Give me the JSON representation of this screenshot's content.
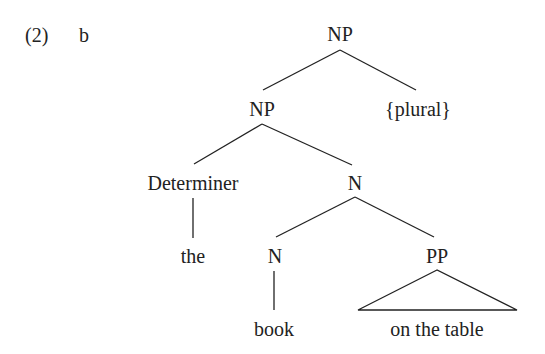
{
  "example": {
    "number": "(2)",
    "letter": "b"
  },
  "tree": {
    "root": "NP",
    "np": "NP",
    "plural": "{plural}",
    "determiner": "Determiner",
    "n_bar": "N",
    "the": "the",
    "n": "N",
    "pp": "PP",
    "book": "book",
    "pp_text": "on the table"
  },
  "colors": {
    "text": "#222222",
    "lines": "#222222",
    "background": "#ffffff"
  }
}
